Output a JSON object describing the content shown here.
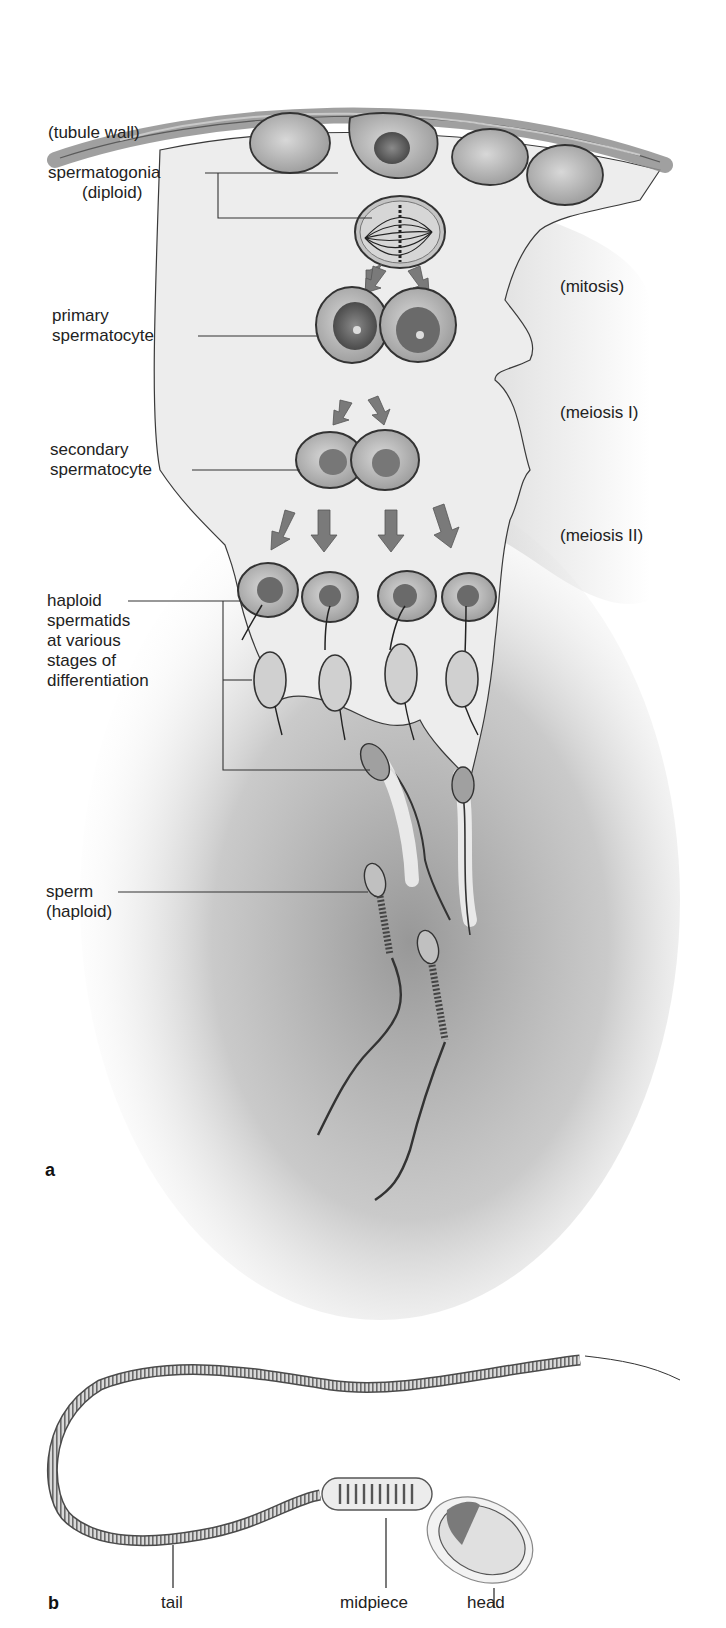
{
  "figure": {
    "panel_a": {
      "letter": "a",
      "labels": {
        "tubule_wall": "(tubule wall)",
        "spermatogonia_line1": "spermatogonia",
        "spermatogonia_line2": "(diploid)",
        "primary_line1": "primary",
        "primary_line2": "spermatocyte",
        "secondary_line1": "secondary",
        "secondary_line2": "spermatocyte",
        "spermatids_line1": "haploid",
        "spermatids_line2": "spermatids",
        "spermatids_line3": "at various",
        "spermatids_line4": "stages of",
        "spermatids_line5": "differentiation",
        "sperm_line1": "sperm",
        "sperm_line2": "(haploid)"
      },
      "stages": {
        "mitosis": "(mitosis)",
        "meiosis_1": "(meiosis I)",
        "meiosis_2": "(meiosis II)"
      }
    },
    "panel_b": {
      "letter": "b",
      "labels": {
        "tail": "tail",
        "midpiece": "midpiece",
        "head": "head"
      }
    },
    "colors": {
      "ink": "#2a2a2a",
      "arrow": "#7a7a7a",
      "cell_fill": "#b8b8b8",
      "shadow": "#8c8c8c",
      "tissue": "#ececec"
    }
  }
}
